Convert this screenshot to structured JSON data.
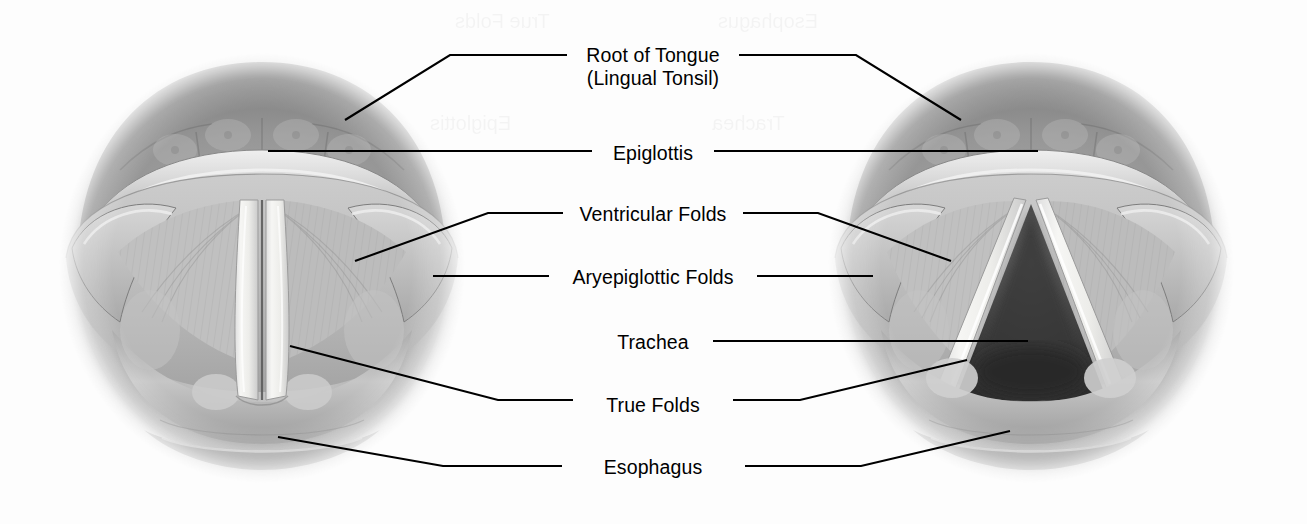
{
  "figure": {
    "background_color": "#fdfdfd",
    "line_color": "#000000",
    "text_color": "#000000"
  },
  "labels": [
    {
      "id": "root-of-tongue",
      "line1": "Root of Tongue",
      "line2": "(Lingual Tonsil)",
      "cx": 653,
      "y": 44
    },
    {
      "id": "epiglottis",
      "line1": "Epiglottis",
      "line2": "",
      "cx": 653,
      "y": 142
    },
    {
      "id": "ventricular-folds",
      "line1": "Ventricular Folds",
      "line2": "",
      "cx": 653,
      "y": 203
    },
    {
      "id": "aryepiglottic-folds",
      "line1": "Aryepiglottic Folds",
      "line2": "",
      "cx": 653,
      "y": 266
    },
    {
      "id": "trachea",
      "line1": "Trachea",
      "line2": "",
      "cx": 653,
      "y": 331
    },
    {
      "id": "true-folds",
      "line1": "True Folds",
      "line2": "",
      "cx": 653,
      "y": 394
    },
    {
      "id": "esophagus",
      "line1": "Esophagus",
      "line2": "",
      "cx": 653,
      "y": 456
    }
  ],
  "ghost_text": [
    {
      "id": "ghost-epiglottis",
      "text": "Epiglottis",
      "x": 430,
      "y": 112
    },
    {
      "id": "ghost-trachea",
      "text": "Trachea",
      "x": 712,
      "y": 112
    },
    {
      "id": "ghost-true-folds",
      "text": "True Folds",
      "x": 455,
      "y": 10
    },
    {
      "id": "ghost-esophagus",
      "text": "Esophagus",
      "x": 718,
      "y": 10
    }
  ],
  "views": [
    {
      "id": "left-view",
      "name": "adducted-larynx",
      "state": "Vocal folds closed (adducted) - phonation",
      "cx": 262,
      "cy": 268,
      "rx": 200,
      "ry": 212
    },
    {
      "id": "right-view",
      "name": "abducted-larynx",
      "state": "Vocal folds open (abducted) - respiration",
      "cx": 1031,
      "cy": 268,
      "rx": 200,
      "ry": 212
    }
  ],
  "leaders": {
    "root_of_tongue_left": "M345,120 L450,55 L567,55",
    "root_of_tongue_right": "M739,55 L856,55 L961,120",
    "epiglottis_left": "M268,151 L592,151",
    "epiglottis_right": "M714,151 L1038,151",
    "ventricular_left": "M355,261 L488,213 L563,213",
    "ventricular_right": "M743,213 L818,213 L951,261",
    "aryepiglottic_left": "M433,276 L549,276",
    "aryepiglottic_right": "M757,276 L873,276",
    "trachea_left": "M278,437 L443,466 L562,466",
    "trachea_right": "M713,341 L1028,341",
    "true_folds_left": "M290,346 L498,400 L573,400",
    "true_folds_right": "M733,400 L800,400 L967,360",
    "esophagus_left": "M278,437 L443,466 L562,466",
    "esophagus_right": "M745,466 L861,466 L1010,431"
  },
  "palette": {
    "tissue_light": "#d2d2d2",
    "tissue_mid": "#b0b0b0",
    "tissue_dark": "#8d8d8d",
    "tissue_deep": "#6d6d6d",
    "fold_white": "#f4f4f2",
    "glottis_dark": "#4a4a4a",
    "glottis_deep": "#2f2f2f",
    "vignette": "#9a9a9a"
  }
}
